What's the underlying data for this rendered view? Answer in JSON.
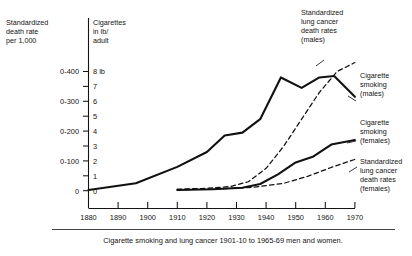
{
  "chart_data": {
    "type": "line",
    "title": "",
    "caption": "Cigarette smoking and lung cancer 1901-10 to 1965-69 men and women.",
    "xlabel": "",
    "xlim": [
      1880,
      1970
    ],
    "grid": false,
    "legend_position": "right-inline",
    "x_ticks": [
      "1880",
      "1890",
      "1900",
      "1910",
      "1920",
      "1930",
      "1940",
      "1950",
      "1960",
      "1970"
    ],
    "axes": [
      {
        "id": "left",
        "header": "Standardized\ndeath rate\nper 1,000",
        "header_lines": [
          "Standardized",
          "death rate",
          "per 1,000"
        ],
        "tick_labels": [
          "0-400",
          "0-300",
          "0-200",
          "0-100",
          "0"
        ],
        "tick_values": [
          400,
          300,
          200,
          100,
          0
        ],
        "ylim": [
          0,
          450
        ]
      },
      {
        "id": "right",
        "header": "Cigarettes\nin lb/\nadult",
        "header_lines": [
          "Cigarettes",
          "in lb/",
          "adult"
        ],
        "tick_labels": [
          "8 lb",
          "7",
          "6",
          "5",
          "4",
          "3",
          "2",
          "1",
          "0"
        ],
        "tick_values": [
          8,
          7,
          6,
          5,
          4,
          3,
          2,
          1,
          0
        ],
        "ylim": [
          0,
          9
        ]
      }
    ],
    "series": [
      {
        "name": "Cigarette smoking (males)",
        "style": "solid",
        "axis": "right",
        "unit": "lb/adult",
        "x": [
          1880,
          1896,
          1910,
          1920,
          1926,
          1932,
          1938,
          1945,
          1952,
          1958,
          1963,
          1970
        ],
        "values": [
          0.05,
          0.5,
          1.6,
          2.6,
          3.7,
          3.9,
          4.8,
          7.6,
          6.9,
          7.6,
          7.7,
          6.3
        ]
      },
      {
        "name": "Standardized lung cancer death rates (males)",
        "style": "dashed",
        "axis": "left",
        "unit": "per 1,000",
        "x": [
          1910,
          1920,
          1928,
          1934,
          1940,
          1946,
          1952,
          1958,
          1964,
          1970
        ],
        "values": [
          5,
          8,
          14,
          30,
          75,
          150,
          240,
          330,
          400,
          430
        ]
      },
      {
        "name": "Cigarette smoking (females)",
        "style": "solid",
        "axis": "right",
        "unit": "lb/adult",
        "x": [
          1910,
          1922,
          1932,
          1938,
          1944,
          1950,
          1956,
          1962,
          1970
        ],
        "values": [
          0.05,
          0.1,
          0.2,
          0.45,
          1.1,
          1.9,
          2.3,
          3.1,
          3.4
        ]
      },
      {
        "name": "Standardized lung cancer death rates (females)",
        "style": "dashed",
        "axis": "left",
        "unit": "per 1,000",
        "x": [
          1910,
          1924,
          1936,
          1946,
          1954,
          1962,
          1970
        ],
        "values": [
          3,
          6,
          12,
          25,
          48,
          78,
          105
        ]
      }
    ],
    "annotations": [
      {
        "id": "male-cancer",
        "lines": [
          "Standardized",
          "lung cancer",
          "death rates",
          "(males)"
        ]
      },
      {
        "id": "male-smoking",
        "lines": [
          "Cigarette",
          "smoking",
          "(males)"
        ]
      },
      {
        "id": "female-smoking",
        "lines": [
          "Cigarette",
          "smoking",
          "(females)"
        ]
      },
      {
        "id": "female-cancer",
        "lines": [
          "Standardized",
          "lung cancer",
          "death rates",
          "(females)"
        ]
      }
    ]
  }
}
